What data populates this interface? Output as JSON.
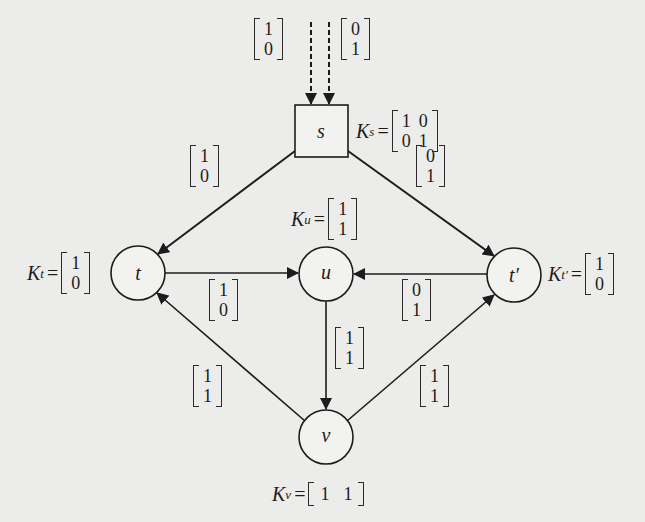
{
  "diagram": {
    "title": "",
    "background": "#ececea",
    "line_color": "#1c1c1c",
    "nodes": [
      {
        "id": "s",
        "label": "s",
        "shape": "square",
        "x": 321,
        "y": 131,
        "size": 53
      },
      {
        "id": "t",
        "label": "t",
        "shape": "circle",
        "x": 138,
        "y": 273,
        "r": 27
      },
      {
        "id": "u",
        "label": "u",
        "shape": "circle",
        "x": 326,
        "y": 274,
        "r": 27
      },
      {
        "id": "t_prime",
        "label": "t′",
        "shape": "circle",
        "x": 514,
        "y": 275,
        "r": 27
      },
      {
        "id": "v",
        "label": "v",
        "shape": "circle",
        "x": 326,
        "y": 437,
        "r": 27
      }
    ],
    "kernels": {
      "s": {
        "name": "K",
        "sub": "s",
        "rows": [
          [
            "1",
            "0"
          ],
          [
            "0",
            "1"
          ]
        ]
      },
      "u": {
        "name": "K",
        "sub": "u",
        "rows": [
          [
            "1"
          ],
          [
            "1"
          ]
        ]
      },
      "t": {
        "name": "K",
        "sub": "t",
        "rows": [
          [
            "1"
          ],
          [
            "0"
          ]
        ]
      },
      "t_prime": {
        "name": "K",
        "sub": "t′",
        "rows": [
          [
            "1"
          ],
          [
            "0"
          ]
        ]
      },
      "v": {
        "name": "K",
        "sub": "v",
        "rows": [
          [
            "1",
            "1"
          ]
        ]
      }
    },
    "edges": [
      {
        "id": "in1",
        "from": "source",
        "to": "s",
        "style": "dashed",
        "vector": [
          "1",
          "0"
        ]
      },
      {
        "id": "in2",
        "from": "source",
        "to": "s",
        "style": "dashed",
        "vector": [
          "0",
          "1"
        ]
      },
      {
        "id": "s_t",
        "from": "s",
        "to": "t",
        "style": "solid",
        "vector": [
          "1",
          "0"
        ]
      },
      {
        "id": "s_tp",
        "from": "s",
        "to": "t′",
        "style": "solid",
        "vector": [
          "0",
          "1"
        ]
      },
      {
        "id": "t_u",
        "from": "t",
        "to": "u",
        "style": "solid",
        "vector": [
          "1",
          "0"
        ]
      },
      {
        "id": "tp_u",
        "from": "t′",
        "to": "u",
        "style": "solid",
        "vector": [
          "0",
          "1"
        ]
      },
      {
        "id": "u_v",
        "from": "u",
        "to": "v",
        "style": "solid",
        "vector": [
          "1",
          "1"
        ]
      },
      {
        "id": "v_t",
        "from": "v",
        "to": "t",
        "style": "solid",
        "vector": [
          "1",
          "1"
        ]
      },
      {
        "id": "v_tp",
        "from": "v",
        "to": "t′",
        "style": "solid",
        "vector": [
          "1",
          "1"
        ]
      }
    ],
    "text": {
      "eq": "=",
      "k": "K"
    }
  }
}
